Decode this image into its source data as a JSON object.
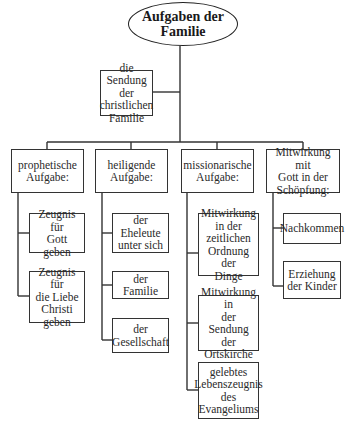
{
  "diagram": {
    "root": {
      "label": "Aufgaben der\nFamilie"
    },
    "mission": {
      "label": "die Sendung der\nchristlichen\nFamilie"
    },
    "branches": [
      {
        "label": "prophetische\nAufgabe:",
        "children": [
          {
            "label": "Zeugnis für\nGott geben"
          },
          {
            "label": "Zeugnis für\ndie Liebe\nChristi\ngeben"
          }
        ]
      },
      {
        "label": "heiligende\nAufgabe:",
        "children": [
          {
            "label": "der Eheleute\nunter sich"
          },
          {
            "label": "der Familie"
          },
          {
            "label": "der\nGesellschaft"
          }
        ]
      },
      {
        "label": "missionarische\nAufgabe:",
        "children": [
          {
            "label": "Mitwirkung\nin der\nzeitlichen\nOrdnung der\nDinge"
          },
          {
            "label": "Mitwirkung in\nder Sendung\nder Ortskirche"
          },
          {
            "label": "gelebtes\nLebenszeugnis\ndes\nEvangeliums"
          }
        ]
      },
      {
        "label": "Mitwirkung mit\nGott in der\nSchöpfung:",
        "children": [
          {
            "label": "Nachkommen"
          },
          {
            "label": "Erziehung\nder Kinder"
          }
        ]
      }
    ]
  }
}
